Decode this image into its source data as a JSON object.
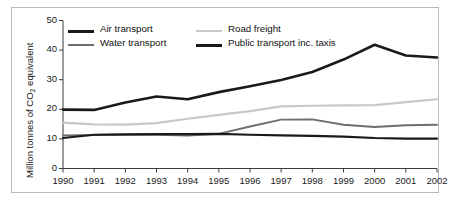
{
  "chart_data": {
    "type": "line",
    "title": "",
    "xlabel": "",
    "ylabel": "Million tonnes of CO2 equivalent",
    "ylabel_parts": {
      "before": "Million tonnes of CO",
      "sub": "2",
      "after": " equivalent"
    },
    "categories": [
      "1990",
      "1991",
      "1992",
      "1993",
      "1994",
      "1995",
      "1996",
      "1997",
      "1998",
      "1999",
      "2000",
      "2001",
      "2002"
    ],
    "x": [
      1990,
      1991,
      1992,
      1993,
      1994,
      1995,
      1996,
      1997,
      1998,
      1999,
      2000,
      2001,
      2002
    ],
    "xlim": [
      1990,
      2002
    ],
    "ylim": [
      0,
      50
    ],
    "yticks": [
      0,
      10,
      20,
      30,
      40,
      50
    ],
    "ytick_labels": [
      "0",
      "10",
      "20",
      "30",
      "40",
      "50"
    ],
    "grid": false,
    "legend_position": "top-inside",
    "series": [
      {
        "name": "Air transport",
        "color": "#1a1a1a",
        "width": 2.6,
        "values": [
          19.9,
          19.8,
          22.3,
          24.3,
          23.4,
          25.8,
          27.8,
          29.9,
          32.6,
          36.8,
          41.8,
          38.2,
          37.5
        ]
      },
      {
        "name": "Water transport",
        "color": "#6e6e6e",
        "width": 1.9,
        "values": [
          11.2,
          11.3,
          11.4,
          11.4,
          11.1,
          11.7,
          14.2,
          16.5,
          16.6,
          14.8,
          14.0,
          14.6,
          14.8
        ]
      },
      {
        "name": "Road freight",
        "color": "#c8c8c8",
        "width": 2.2,
        "values": [
          15.5,
          14.9,
          14.8,
          15.3,
          16.8,
          18.1,
          19.4,
          21.0,
          21.2,
          21.3,
          21.4,
          22.4,
          23.4
        ]
      },
      {
        "name": "Public transport inc. taxis",
        "color": "#1a1a1a",
        "width": 2.2,
        "values": [
          10.3,
          11.4,
          11.5,
          11.6,
          11.6,
          11.7,
          11.4,
          11.2,
          11.0,
          10.8,
          10.3,
          10.1,
          10.1
        ]
      }
    ]
  },
  "legend": {
    "items": [
      {
        "label": "Air transport",
        "color": "#1a1a1a",
        "width": 2.8
      },
      {
        "label": "Water transport",
        "color": "#6e6e6e",
        "width": 2.4
      },
      {
        "label": "Road freight",
        "color": "#c8c8c8",
        "width": 2.4
      },
      {
        "label": "Public transport inc. taxis",
        "color": "#1a1a1a",
        "width": 2.8
      }
    ]
  },
  "axes": {
    "y_title_before": "Million tonnes of CO",
    "y_title_sub": "2",
    "y_title_after": " equivalent"
  }
}
